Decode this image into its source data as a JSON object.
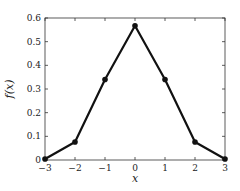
{
  "chart_data": {
    "type": "line",
    "title": "",
    "xlabel": "x",
    "ylabel": "f(x)",
    "x": [
      -3,
      -2,
      -1,
      0,
      1,
      2,
      3
    ],
    "values": [
      0.004,
      0.076,
      0.34,
      0.567,
      0.34,
      0.076,
      0.004
    ],
    "xlim": [
      -3,
      3
    ],
    "ylim": [
      0,
      0.6
    ],
    "xticks": [
      "−3",
      "−2",
      "−1",
      "0",
      "1",
      "2",
      "3"
    ],
    "yticks": [
      "0",
      "0.1",
      "0.2",
      "0.3",
      "0.4",
      "0.5",
      "0.6"
    ],
    "grid": false,
    "markers": true,
    "line_color": "#111111"
  }
}
